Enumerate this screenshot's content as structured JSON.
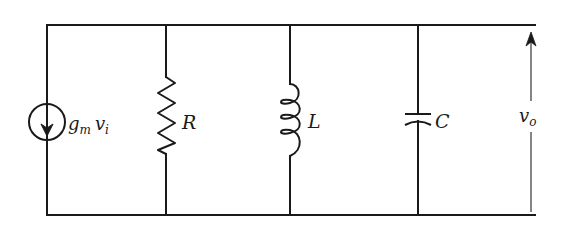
{
  "diagram": {
    "type": "parallel RLC circuit with dependent current source",
    "components": [
      {
        "id": "current-source",
        "kind": "dependent current source",
        "label_main": "g",
        "label_sub1": "m",
        "label_main2": "v",
        "label_sub2": "i",
        "direction": "down"
      },
      {
        "id": "resistor",
        "kind": "resistor",
        "label": "R"
      },
      {
        "id": "inductor",
        "kind": "inductor",
        "label": "L"
      },
      {
        "id": "capacitor",
        "kind": "capacitor",
        "label": "C"
      }
    ],
    "output": {
      "label_main": "v",
      "label_sub": "o",
      "arrow_direction": "up"
    },
    "colors": {
      "stroke": "#1a1a1a",
      "background": "#ffffff"
    }
  }
}
